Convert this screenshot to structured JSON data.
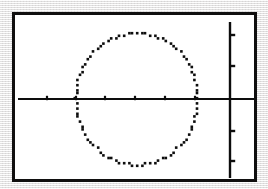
{
  "device": {
    "kind": "graphing-calculator-screen",
    "screen_background": "#ffffff",
    "frame_color": "#100f0f",
    "page_background": "#eceaea"
  },
  "chart_data": {
    "type": "scatter",
    "title": "",
    "subtitle": "",
    "xlabel": "",
    "ylabel": "",
    "grid": false,
    "legend": null,
    "legend_position": "none",
    "plot_color": "#0d0d0d",
    "axes": {
      "x_axis": {
        "visible": true,
        "pixel_y": 84,
        "pixel_x_start": 3,
        "pixel_x_end": 239,
        "tick_pixels": [
          32,
          61,
          90,
          120,
          150,
          180
        ],
        "tick_spacing_px": 29.5,
        "tick_labels": [],
        "origin_pixel_x": 215
      },
      "y_axis": {
        "visible": true,
        "pixel_x": 215,
        "pixel_y_start": 7,
        "pixel_y_end": 163,
        "tick_pixels": [
          20,
          51,
          116,
          146
        ],
        "tick_spacing_px": 31,
        "tick_labels": [],
        "origin_pixel_y": 84
      },
      "xlim": [
        -7.3,
        1.0
      ],
      "ylim": [
        -2.55,
        2.55
      ]
    },
    "series": [
      {
        "name": "circle",
        "shape": "circle",
        "style": "pixelated-dotted",
        "center": {
          "x": -2.75,
          "y": 0.0
        },
        "radius_x_units": 2.05,
        "radius_y_units": 2.2,
        "center_pixel": {
          "x": 122,
          "y": 84
        },
        "radius_pixel_x": 61,
        "radius_pixel_y": 66,
        "equation": "(x + 2.75)^2 + y^2 = r^2",
        "point_count": 88
      }
    ],
    "annotations": []
  },
  "accessibility": {
    "description": "Calculator screen showing a circle graph with horizontal and vertical axes"
  }
}
